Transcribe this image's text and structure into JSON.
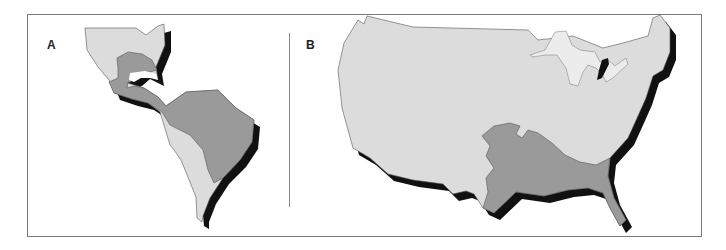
{
  "figure": {
    "panels": [
      {
        "label": "A",
        "region": "Americas (North, Central, South)"
      },
      {
        "label": "B",
        "region": "Contiguous United States"
      }
    ]
  },
  "colors": {
    "light_region": "#dcdcdc",
    "dark_region": "#9a9a9a",
    "great_lakes": "#ececec",
    "shadow": "#111111",
    "outline": "#555555",
    "frame": "#7a7a7a"
  }
}
